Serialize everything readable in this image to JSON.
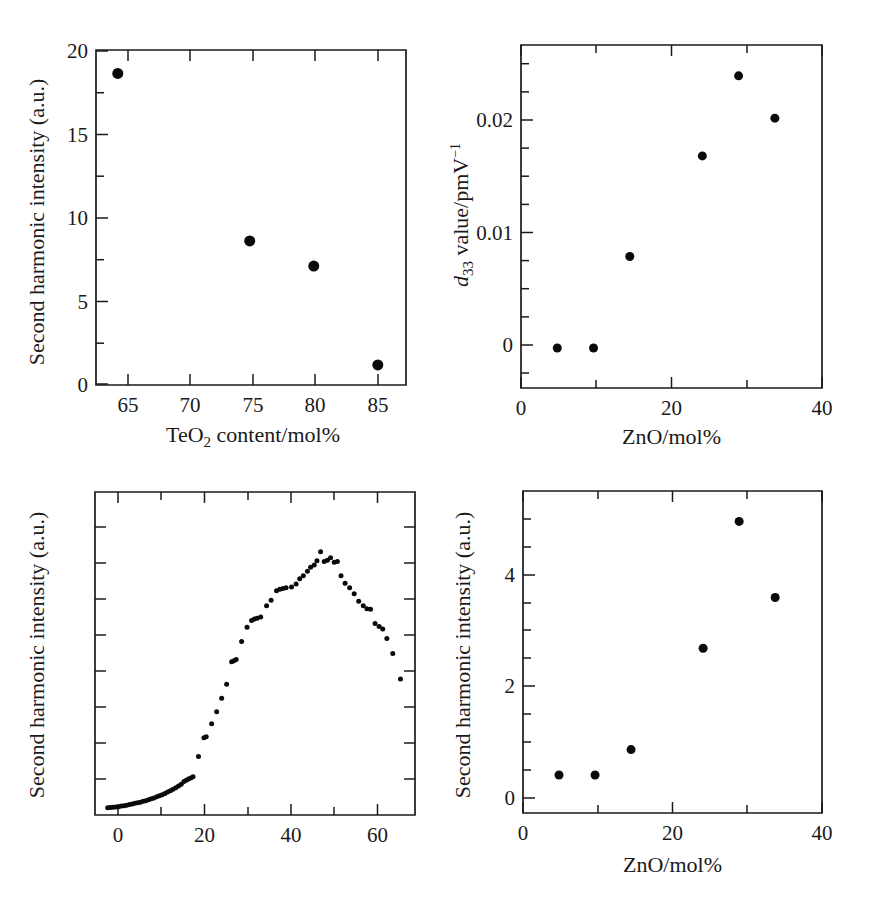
{
  "figure": {
    "title": "",
    "background": "#ffffff",
    "marker_color": "#0a0a0a",
    "axis_color": "#1a1a1a"
  },
  "panels": {
    "top_left": {
      "ylabel": "Second harmonic intensity (a.u.)",
      "xlabel_parts": {
        "pre": "TeO",
        "sub": "2",
        "post": " content/mol%"
      },
      "xlabel": "TeO2 content/mol%",
      "xticks": [
        "65",
        "70",
        "75",
        "80",
        "85"
      ],
      "yticks": [
        "0",
        "5",
        "10",
        "15",
        "20"
      ]
    },
    "top_right": {
      "ylabel_parts": {
        "pre": "d",
        "sub": "33",
        "mid": " value/pmV",
        "sup": "−1"
      },
      "ylabel": "d33 value/pmV-1",
      "xlabel": "ZnO/mol%",
      "xticks": [
        "0",
        "20",
        "40"
      ],
      "yticks": [
        "0",
        "0.01",
        "0.02"
      ]
    },
    "bottom_left": {
      "ylabel": "Second harmonic intensity (a.u.)",
      "xlabel": "",
      "xticks": [
        "0",
        "20",
        "40",
        "60"
      ],
      "yticks": []
    },
    "bottom_right": {
      "ylabel": "Second harmonic intensity (a.u.)",
      "xlabel": "ZnO/mol%",
      "xticks": [
        "0",
        "20",
        "40"
      ],
      "yticks": [
        "0",
        "2",
        "4"
      ]
    }
  },
  "chart_data": [
    {
      "id": "top_left",
      "type": "scatter",
      "title": "",
      "xlabel": "TeO2 content/mol%",
      "ylabel": "Second harmonic intensity (a.u.)",
      "xlim": [
        63.0,
        87.2
      ],
      "ylim": [
        0,
        20
      ],
      "xticks": [
        65,
        70,
        75,
        80,
        85
      ],
      "yticks": [
        0,
        5,
        10,
        15,
        20
      ],
      "minor_xticks": [],
      "minor_yticks": [
        2.5,
        7.5,
        12.5,
        17.5
      ],
      "grid": false,
      "legend": null,
      "marker_size": 11,
      "x": [
        64.7,
        75.0,
        80.0,
        85.0
      ],
      "y": [
        18.6,
        8.6,
        7.1,
        1.2
      ]
    },
    {
      "id": "top_right",
      "type": "scatter",
      "title": "",
      "xlabel": "ZnO/mol%",
      "ylabel": "d33 value/pmV-1",
      "xlim": [
        0,
        41.5
      ],
      "ylim": [
        -0.0035,
        0.0265
      ],
      "xticks": [
        0,
        20,
        40
      ],
      "yticks": [
        0,
        0.01,
        0.02
      ],
      "minor_xticks": [
        10,
        30
      ],
      "minor_yticks": [
        0.0025,
        0.005,
        0.0075,
        0.0125,
        0.015,
        0.0175,
        0.0225,
        0.025,
        -0.0025
      ],
      "grid": false,
      "legend": null,
      "marker_size": 9,
      "x": [
        5,
        10,
        15,
        25,
        30,
        35
      ],
      "y": [
        0.0,
        0.0,
        0.008,
        0.0168,
        0.0238,
        0.0201
      ]
    },
    {
      "id": "bottom_left",
      "type": "scatter",
      "title": "",
      "xlabel": "",
      "ylabel": "Second harmonic intensity (a.u.)",
      "xlim": [
        -2.5,
        68.0
      ],
      "ylim": [
        0,
        1.08
      ],
      "xticks": [
        0,
        20,
        40,
        60
      ],
      "yticks": [],
      "minor_xticks": [
        10,
        30,
        50
      ],
      "minor_yticks": [
        0.11,
        0.22,
        0.33,
        0.44,
        0.55,
        0.66,
        0.77,
        0.88,
        0.99
      ],
      "grid": false,
      "legend": null,
      "marker_size": 5,
      "x": [
        0.3,
        0.9,
        1.5,
        2.1,
        2.7,
        3.3,
        3.9,
        4.5,
        5.1,
        5.7,
        6.3,
        6.9,
        7.5,
        8.1,
        8.7,
        9.3,
        9.9,
        10.5,
        11.1,
        11.7,
        12.3,
        12.9,
        13.5,
        14.1,
        14.7,
        15.3,
        15.9,
        16.5,
        17.1,
        17.6,
        18.1,
        18.6,
        19.1,
        20.3,
        21.5,
        22.0,
        23.2,
        24.3,
        25.4,
        26.5,
        27.6,
        28.1,
        28.6,
        29.8,
        31.0,
        32.0,
        32.6,
        33.2,
        34.0,
        35.3,
        36.3,
        37.5,
        38.2,
        38.9,
        39.6,
        40.8,
        41.8,
        42.6,
        43.4,
        44.3,
        45.0,
        45.8,
        46.4,
        47.2,
        48.0,
        48.7,
        49.4,
        50.2,
        50.9,
        51.7,
        52.6,
        53.6,
        54.6,
        55.6,
        56.6,
        57.4,
        58.2,
        59.2,
        60.1,
        60.9,
        61.8,
        63.1,
        64.8
      ],
      "y": [
        0.024,
        0.025,
        0.026,
        0.027,
        0.028,
        0.03,
        0.031,
        0.033,
        0.035,
        0.037,
        0.039,
        0.041,
        0.043,
        0.046,
        0.048,
        0.051,
        0.054,
        0.057,
        0.061,
        0.064,
        0.068,
        0.072,
        0.077,
        0.081,
        0.086,
        0.091,
        0.097,
        0.103,
        0.112,
        0.116,
        0.12,
        0.124,
        0.128,
        0.196,
        0.258,
        0.262,
        0.305,
        0.345,
        0.39,
        0.437,
        0.512,
        0.516,
        0.52,
        0.58,
        0.628,
        0.65,
        0.655,
        0.658,
        0.662,
        0.7,
        0.718,
        0.75,
        0.755,
        0.757,
        0.76,
        0.762,
        0.772,
        0.79,
        0.8,
        0.815,
        0.828,
        0.836,
        0.85,
        0.88,
        0.848,
        0.852,
        0.86,
        0.845,
        0.848,
        0.8,
        0.775,
        0.76,
        0.74,
        0.715,
        0.7,
        0.69,
        0.688,
        0.64,
        0.63,
        0.622,
        0.59,
        0.54,
        0.455
      ]
    },
    {
      "id": "bottom_right",
      "type": "scatter",
      "title": "",
      "xlabel": "ZnO/mol%",
      "ylabel": "Second harmonic intensity (a.u.)",
      "xlim": [
        0,
        41.5
      ],
      "ylim": [
        -0.75,
        5.6
      ],
      "xticks": [
        0,
        20,
        40
      ],
      "yticks": [
        0,
        2,
        4
      ],
      "minor_xticks": [
        10,
        30
      ],
      "minor_yticks": [
        -0.5,
        0.5,
        1.0,
        1.5,
        2.5,
        3.0,
        3.5,
        4.5,
        5.0
      ],
      "grid": false,
      "legend": null,
      "marker_size": 9,
      "x": [
        5,
        10,
        15,
        25,
        30,
        35
      ],
      "y": [
        0.0,
        0.0,
        0.5,
        2.5,
        5.0,
        3.5
      ]
    }
  ]
}
